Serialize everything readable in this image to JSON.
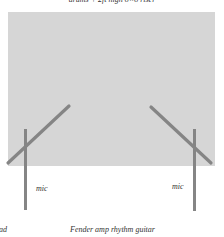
{
  "diagram": {
    "title": "drums + 2ft high 8×8 riser",
    "riser": {
      "fill": "#d6d6d6"
    },
    "stand_color": "#858585",
    "mics": [
      {
        "label": "mic",
        "side": "left"
      },
      {
        "label": "mic",
        "side": "right"
      }
    ],
    "bottom_labels": {
      "left": "ad",
      "center": "Fender amp  rhythm guitar"
    }
  }
}
